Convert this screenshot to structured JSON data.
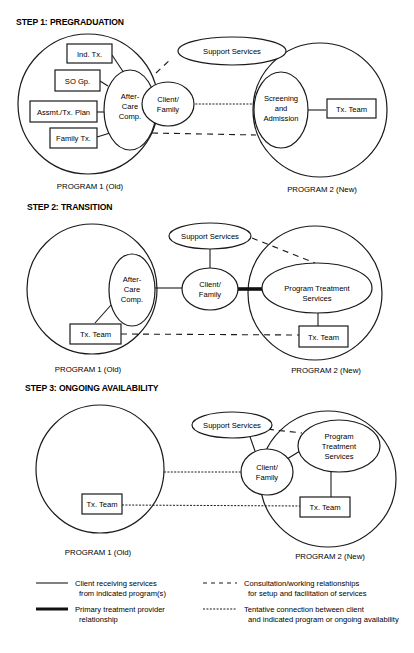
{
  "steps": [
    {
      "title": "STEP 1: PREGRADUATION",
      "program1": {
        "label": "PROGRAM 1 (Old)",
        "boxes": [
          "Ind. Tx.",
          "SO Gp.",
          "Assmt./Tx. Plan",
          "Family Tx."
        ],
        "aftercare": [
          "After-",
          "Care",
          "Comp."
        ]
      },
      "client": [
        "Client/",
        "Family"
      ],
      "support": "Support Services",
      "program2": {
        "label": "PROGRAM 2 (New)",
        "screening": [
          "Screening",
          "and",
          "Admission"
        ],
        "team": "Tx. Team"
      }
    },
    {
      "title": "STEP 2: TRANSITION",
      "program1": {
        "label": "PROGRAM 1 (Old)",
        "aftercare": [
          "After-",
          "Care",
          "Comp."
        ],
        "team": "Tx. Team"
      },
      "client": [
        "Client/",
        "Family"
      ],
      "support": "Support Services",
      "program2": {
        "label": "PROGRAM 2 (New)",
        "treatment": [
          "Program Treatment",
          "Services"
        ],
        "team": "Tx. Team"
      }
    },
    {
      "title": "STEP 3: ONGOING AVAILABILITY",
      "program1": {
        "label": "PROGRAM 1 (Old)",
        "team": "Tx. Team"
      },
      "client": [
        "Client/",
        "Family"
      ],
      "support": "Support Services",
      "program2": {
        "label": "PROGRAM 2 (New)",
        "treatment": [
          "Program",
          "Treatment",
          "Services"
        ],
        "team": "Tx. Team"
      }
    }
  ],
  "legend": {
    "solid": [
      "Client receiving services",
      "from indicated program(s)"
    ],
    "thick": [
      "Primary treatment provider",
      "relationship"
    ],
    "dashed": [
      "Consultation/working relationships",
      "for setup and facilitation of services"
    ],
    "dotted": [
      "Tentative connection between client",
      "and indicated program or ongoing availability"
    ]
  }
}
